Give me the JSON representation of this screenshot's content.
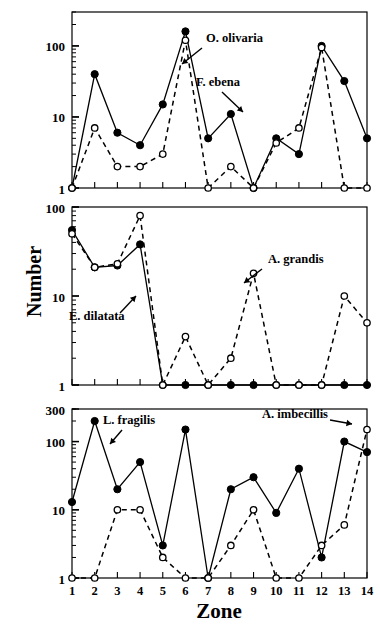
{
  "figure": {
    "y_axis_title": "Number",
    "x_axis_title": "Zone"
  },
  "chart_data": [
    {
      "type": "line",
      "panel": "top",
      "title": "",
      "xlabel": "",
      "ylabel": "Number",
      "x": [
        1,
        2,
        3,
        4,
        5,
        6,
        7,
        8,
        9,
        10,
        11,
        12,
        13,
        14
      ],
      "xticklabels": [
        "1",
        "2",
        "3",
        "4",
        "5",
        "6",
        "7",
        "8",
        "9",
        "10",
        "11",
        "12",
        "13",
        "14"
      ],
      "xlim": [
        1,
        14
      ],
      "ylim": [
        1,
        300
      ],
      "yscale": "log",
      "yticks": [
        1,
        10,
        100
      ],
      "yticklabels": [
        "1",
        "10",
        "100"
      ],
      "grid": false,
      "legend": "annotations",
      "series": [
        {
          "name": "O. olivaria",
          "marker": "filled-circle",
          "linestyle": "solid",
          "values": [
            1,
            40,
            6,
            4,
            15,
            160,
            5,
            11,
            1,
            5,
            3,
            100,
            32,
            5
          ]
        },
        {
          "name": "F. ebena",
          "marker": "open-circle",
          "linestyle": "dashed",
          "values": [
            1,
            7,
            2,
            2,
            3,
            120,
            1,
            2,
            1,
            4.3,
            7,
            95,
            1,
            1
          ]
        }
      ],
      "annotations": [
        {
          "text": "O. olivaria",
          "arrow_to_series": "O. olivaria"
        },
        {
          "text": "F. ebena",
          "arrow_to_series": "F. ebena"
        }
      ]
    },
    {
      "type": "line",
      "panel": "middle",
      "title": "",
      "xlabel": "",
      "ylabel": "Number",
      "x": [
        1,
        2,
        3,
        4,
        5,
        6,
        7,
        8,
        9,
        10,
        11,
        12,
        13,
        14
      ],
      "xticklabels": [
        "1",
        "2",
        "3",
        "4",
        "5",
        "6",
        "7",
        "8",
        "9",
        "10",
        "11",
        "12",
        "13",
        "14"
      ],
      "xlim": [
        1,
        14
      ],
      "ylim": [
        1,
        100
      ],
      "yscale": "log",
      "yticks": [
        1,
        10,
        100
      ],
      "yticklabels": [
        "1",
        "10",
        "100"
      ],
      "grid": false,
      "legend": "annotations",
      "series": [
        {
          "name": "E. dilatata",
          "marker": "filled-circle",
          "linestyle": "solid",
          "values": [
            55,
            21,
            22,
            38,
            1,
            1,
            1,
            1,
            1,
            1,
            1,
            1,
            1,
            1
          ]
        },
        {
          "name": "A. grandis",
          "marker": "open-circle",
          "linestyle": "dashed",
          "values": [
            50,
            21,
            23,
            80,
            1,
            3.5,
            1,
            2,
            18,
            1,
            1,
            1,
            10,
            5
          ]
        }
      ],
      "annotations": [
        {
          "text": "E. dilatata",
          "arrow_to_series": "E. dilatata"
        },
        {
          "text": "A. grandis",
          "arrow_to_series": "A. grandis"
        }
      ]
    },
    {
      "type": "line",
      "panel": "bottom",
      "title": "",
      "xlabel": "Zone",
      "ylabel": "Number",
      "x": [
        1,
        2,
        3,
        4,
        5,
        6,
        7,
        8,
        9,
        10,
        11,
        12,
        13,
        14
      ],
      "xticklabels": [
        "1",
        "2",
        "3",
        "4",
        "5",
        "6",
        "7",
        "8",
        "9",
        "10",
        "11",
        "12",
        "13",
        "14"
      ],
      "xlim": [
        1,
        14
      ],
      "ylim": [
        1,
        300
      ],
      "yscale": "log",
      "yticks": [
        1,
        10,
        100,
        300
      ],
      "yticklabels": [
        "1",
        "10",
        "100",
        "300"
      ],
      "grid": false,
      "legend": "annotations",
      "series": [
        {
          "name": "L. fragilis",
          "marker": "filled-circle",
          "linestyle": "solid",
          "values": [
            13,
            200,
            20,
            50,
            3,
            150,
            1,
            20,
            30,
            9,
            40,
            2,
            100,
            70
          ]
        },
        {
          "name": "A. imbecillis",
          "marker": "open-circle",
          "linestyle": "dashed",
          "values": [
            1,
            1,
            10,
            10,
            2,
            1,
            1,
            3,
            10,
            1,
            1,
            3,
            6,
            150
          ]
        }
      ],
      "annotations": [
        {
          "text": "L. fragilis",
          "arrow_to_series": "L. fragilis"
        },
        {
          "text": "A. imbecillis",
          "arrow_to_series": "A. imbecillis"
        }
      ]
    }
  ]
}
